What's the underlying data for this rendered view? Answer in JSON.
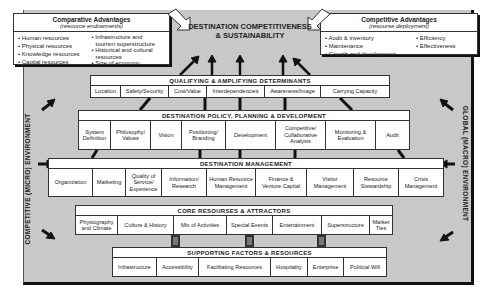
{
  "comparative": {
    "title": "Comparative Advantages",
    "subtitle": "(resource endowments)",
    "col1": [
      "• Human resources",
      "• Physical resources",
      "• Knowledge resources",
      "• Capital resources"
    ],
    "col2": [
      "• Infrastructure and",
      "  tourism superstructure",
      "• Historical and cultural",
      "  resources",
      "• Size of economy"
    ]
  },
  "competitive": {
    "title": "Competitive Advantages",
    "subtitle": "(resourse deployment)",
    "col1": [
      "• Audit & inventory",
      "• Maintenance",
      "• Growth and development"
    ],
    "col2": [
      "• Efficiency",
      "• Effectiveness"
    ]
  },
  "center": {
    "line1": "DESTINATION COMPETITIVENESS",
    "line2": "& SUSTAINABILITY"
  },
  "side_left": "COMPETITIVE (MICRO) ENVIRONMENT",
  "side_right": "GLOBAL (MACRO) ENVIRONMENT",
  "qualifying": {
    "title": "QUALIFYING & AMPLIFYING DETERMINANTS",
    "items": [
      "Location",
      "Safety/Security",
      "Cost/Value",
      "Interdependencies",
      "Awareness/Image",
      "Carrying Capacity"
    ]
  },
  "policy": {
    "title": "DESTINATION POLICY, PLANNING & DEVELOPMENT",
    "items": [
      "System Definition",
      "Philosophy/ Values",
      "Vision",
      "Positioning/ Branding",
      "Development",
      "Competitive/ Collaborative Analysis",
      "Monitoring & Evaluation",
      "Audit"
    ]
  },
  "management": {
    "title": "DESTINATION MANAGEMENT",
    "items": [
      "Organization",
      "Marketing",
      "Quality of Service/ Experience",
      "Information/ Research",
      "Human Resource Management",
      "Finance & Venture Capital",
      "Visitor Management",
      "Resource Stewardship",
      "Crisis Management"
    ]
  },
  "core": {
    "title": "CORE RESOURSES & ATTRACTORS",
    "items": [
      "Physiography and Climate",
      "Culture & History",
      "Mix of Activities",
      "Special Events",
      "Entertainment",
      "Superstructure",
      "Market Ties"
    ]
  },
  "supporting": {
    "title": "SUPPORTING FACTORS & RESOURCES",
    "items": [
      "Infrastructure",
      "Accessibility",
      "Facilitating Resources",
      "Hospitality",
      "Enterprise",
      "Political Will"
    ]
  }
}
